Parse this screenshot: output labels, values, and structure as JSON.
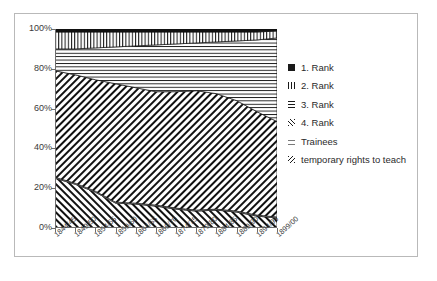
{
  "chart_data": {
    "type": "area",
    "title": "",
    "subtitle": "",
    "xlabel": "",
    "ylabel": "",
    "stacked": true,
    "normalized": "100%",
    "grid": false,
    "legend_position": "right",
    "ylim": [
      0,
      100
    ],
    "ytick_labels": [
      "0%",
      "20%",
      "40%",
      "60%",
      "80%",
      "100%"
    ],
    "ytick_values": [
      0,
      20,
      40,
      60,
      80,
      100
    ],
    "categories": [
      "1844/45",
      "1849/50",
      "1854/55",
      "1859/60",
      "1864/65",
      "1869/70",
      "1874/75",
      "1879/80",
      "1884/85",
      "1889/90",
      "1894/95",
      "1899/00"
    ],
    "series": [
      {
        "name": "1. Rank",
        "pattern": "solid",
        "marker": "solid-black-swatch",
        "values": [
          1.5,
          1.5,
          1.5,
          1.5,
          1.5,
          1.5,
          1.5,
          1.5,
          1.5,
          1.5,
          1.5,
          1.5
        ]
      },
      {
        "name": "2. Rank",
        "pattern": "vertical-lines",
        "marker": "vertical-line-swatch",
        "values": [
          8.5,
          8.5,
          8.0,
          7.5,
          7.0,
          6.5,
          6.0,
          5.5,
          5.0,
          4.5,
          4.0,
          3.5
        ]
      },
      {
        "name": "3. Rank",
        "pattern": "horizontal-lines",
        "marker": "horizontal-line-swatch",
        "values": [
          11.0,
          13.0,
          16.0,
          18.5,
          21.0,
          23.5,
          24.0,
          24.0,
          26.0,
          30.0,
          36.0,
          42.0
        ]
      },
      {
        "name": "4. Rank",
        "pattern": "forward-diagonal",
        "marker": "diagonal-line-swatch",
        "values": [
          53.5,
          54.5,
          56.0,
          59.5,
          58.0,
          57.0,
          58.5,
          60.0,
          58.0,
          55.5,
          52.0,
          48.0
        ]
      },
      {
        "name": "Trainees",
        "pattern": "fine-dots",
        "marker": "dotted-swatch",
        "values": [
          0.5,
          0.5,
          0.5,
          0.5,
          0.5,
          0.5,
          0.5,
          0.5,
          0.5,
          0.5,
          0.5,
          0.5
        ]
      },
      {
        "name": "temporary rights to teach",
        "pattern": "back-diagonal",
        "marker": "back-diagonal-swatch",
        "values": [
          25.0,
          22.0,
          18.0,
          12.5,
          12.0,
          11.0,
          9.5,
          8.5,
          9.0,
          8.0,
          6.0,
          5.0
        ]
      }
    ],
    "stack_order_bottom_to_top": [
      "temporary rights to teach",
      "Trainees",
      "4. Rank",
      "3. Rank",
      "2. Rank",
      "1. Rank"
    ],
    "cumulative_boundaries_percent": {
      "note": "top edge of each band, bottom-to-top, read off the plot",
      "temporary rights to teach": [
        25.0,
        22.0,
        18.0,
        12.5,
        12.0,
        11.0,
        9.5,
        8.5,
        9.0,
        8.0,
        6.0,
        5.0
      ],
      "Trainees": [
        25.5,
        22.5,
        18.5,
        13.0,
        12.5,
        11.5,
        10.0,
        9.0,
        9.5,
        8.5,
        6.5,
        5.5
      ],
      "4. Rank": [
        79.0,
        77.0,
        74.5,
        72.5,
        70.5,
        68.5,
        68.5,
        69.0,
        67.5,
        64.0,
        58.5,
        53.5
      ],
      "3. Rank": [
        90.0,
        90.0,
        90.5,
        91.0,
        91.5,
        92.0,
        92.5,
        93.0,
        93.5,
        94.0,
        94.5,
        95.5
      ],
      "2. Rank": [
        98.5,
        98.5,
        98.5,
        98.5,
        98.5,
        98.5,
        98.5,
        98.5,
        98.5,
        98.5,
        98.5,
        99.0
      ],
      "1. Rank": [
        100,
        100,
        100,
        100,
        100,
        100,
        100,
        100,
        100,
        100,
        100,
        100
      ]
    }
  },
  "legend": {
    "items": [
      {
        "label": "1. Rank",
        "swatch": "sw-solid"
      },
      {
        "label": "2. Rank",
        "swatch": "sw-vert"
      },
      {
        "label": "3. Rank",
        "swatch": "sw-horz"
      },
      {
        "label": "4. Rank",
        "swatch": "sw-diag"
      },
      {
        "label": "Trainees",
        "swatch": "sw-dots"
      },
      {
        "label": "temporary rights to teach",
        "swatch": "sw-bdiag"
      }
    ]
  }
}
